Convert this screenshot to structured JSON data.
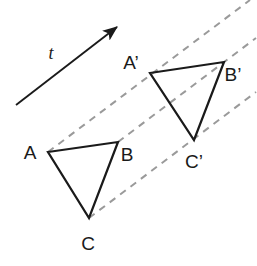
{
  "figure": {
    "background_color": "#ffffff",
    "stroke_color": "#1a1a1a",
    "dashed_color": "#9a9a9a",
    "width": 257,
    "height": 266
  },
  "vector": {
    "label": "t",
    "label_x": 51,
    "label_y": 55,
    "tail_x": 16,
    "tail_y": 105,
    "tip_x": 117,
    "tip_y": 27
  },
  "triangles": [
    {
      "name": "triangle-abc",
      "points": "48,152 118,142 89,218",
      "vertices": [
        {
          "name": "A",
          "label": "A",
          "x": 48,
          "y": 152,
          "label_x": 30,
          "label_y": 154
        },
        {
          "name": "B",
          "label": "B",
          "x": 118,
          "y": 142,
          "label_x": 127,
          "label_y": 156
        },
        {
          "name": "C",
          "label": "C",
          "x": 89,
          "y": 218,
          "label_x": 88,
          "label_y": 245
        }
      ]
    },
    {
      "name": "triangle-abc-prime",
      "points": "150,73 224,62 194,140",
      "vertices": [
        {
          "name": "A-prime",
          "label": "A’",
          "x": 150,
          "y": 73,
          "label_x": 131,
          "label_y": 64
        },
        {
          "name": "B-prime",
          "label": "B’",
          "x": 224,
          "y": 62,
          "label_x": 233,
          "label_y": 76
        },
        {
          "name": "C-prime",
          "label": "C’",
          "x": 194,
          "y": 140,
          "label_x": 194,
          "label_y": 163
        }
      ]
    }
  ],
  "translation_lines": [
    {
      "name": "dashed-line-a-to-aprime",
      "x1": 48,
      "y1": 152,
      "x2": 250,
      "y2": 0
    },
    {
      "name": "dashed-line-b-to-bprime",
      "x1": 118,
      "y1": 142,
      "x2": 256,
      "y2": 38
    },
    {
      "name": "dashed-line-c-to-cprime",
      "x1": 89,
      "y1": 218,
      "x2": 256,
      "y2": 92
    }
  ]
}
